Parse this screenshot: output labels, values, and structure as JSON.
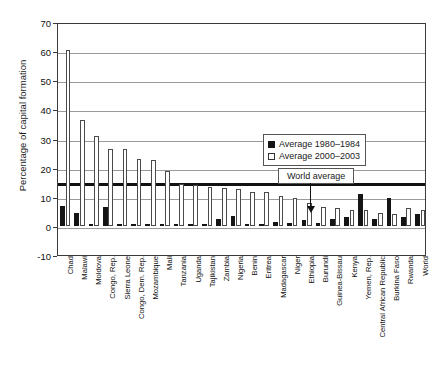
{
  "chart_data": {
    "type": "bar",
    "title": "",
    "xlabel": "",
    "ylabel": "Percentage of capital formation",
    "ylim": [
      -10,
      70
    ],
    "yticks": [
      -10,
      0,
      10,
      20,
      30,
      40,
      50,
      60,
      70
    ],
    "grid": true,
    "legend_position": "top-right-inside",
    "categories": [
      "Chad",
      "Malawi",
      "Moldova",
      "Congo, Rep.",
      "Sierra Leone",
      "Congo, Dem. Rep.",
      "Mozambique",
      "Mali",
      "Tanzania",
      "Uganda",
      "Tajikistan",
      "Zambia",
      "Nigeria",
      "Benin",
      "Eritrea",
      "Madagascar",
      "Niger",
      "Ethiopia",
      "Burundi",
      "Guinea-Bissau",
      "Kenya",
      "Yemen, Rep.",
      "Central African Republic",
      "Burkina Faso",
      "Rwanda",
      "World"
    ],
    "series": [
      {
        "name": "Average 1980–1984",
        "color": "#151515",
        "values": [
          7.0,
          4.5,
          0.0,
          6.5,
          0.5,
          0.3,
          0.3,
          0.4,
          0.4,
          0.5,
          0.0,
          2.5,
          3.5,
          0.4,
          0.0,
          1.5,
          1.0,
          2.0,
          1.0,
          2.5,
          3.0,
          11.0,
          2.5,
          9.5,
          3.0,
          4.0
        ]
      },
      {
        "name": "Average 2000–2003",
        "color": "#ffffff",
        "values": [
          60.5,
          36.5,
          30.8,
          26.5,
          26.3,
          23.0,
          22.5,
          19.0,
          14.5,
          14.0,
          13.5,
          13.0,
          12.5,
          11.8,
          11.5,
          10.2,
          9.5,
          8.0,
          6.5,
          6.0,
          5.5,
          5.5,
          4.5,
          4.0,
          6.0,
          5.5
        ]
      }
    ],
    "annotations": [
      {
        "name": "world-average",
        "label": "World average",
        "value": 15,
        "type": "hline-callout"
      }
    ]
  },
  "legend": {
    "items": [
      {
        "label": "Average 1980–1984",
        "swatch": "dark"
      },
      {
        "label": "Average 2000–2003",
        "swatch": "light"
      }
    ]
  },
  "callout": {
    "label": "World average"
  }
}
